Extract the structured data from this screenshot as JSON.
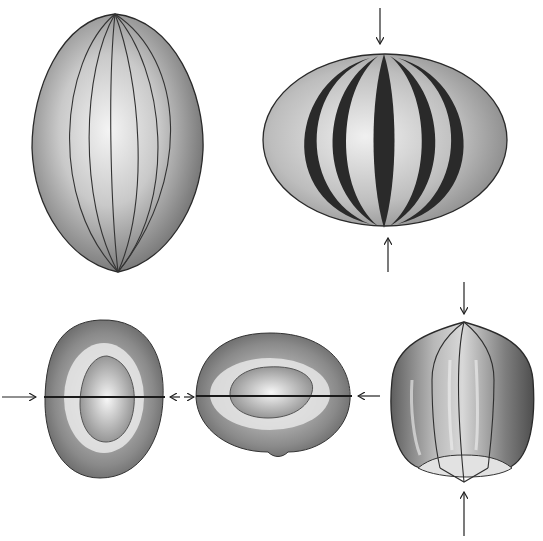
{
  "diagram": {
    "background": "#ffffff",
    "ink": "#1a1a1a",
    "figures": [
      {
        "id": "prolate-ribbed-ellipsoid",
        "position": "top-left",
        "arrows": 0,
        "ribs": 8
      },
      {
        "id": "oblate-striped-ellipsoid",
        "position": "top-right",
        "arrows": 2,
        "arrow_axis": "vertical",
        "stripes": 7
      },
      {
        "id": "cross-section-vertical-oval",
        "position": "bottom-left",
        "arrows": 2,
        "arrow_axis": "horizontal"
      },
      {
        "id": "cross-section-horizontal-oval",
        "position": "bottom-center",
        "arrows": 2,
        "arrow_axis": "horizontal"
      },
      {
        "id": "compressed-ribbed-body",
        "position": "bottom-right",
        "arrows": 2,
        "arrow_axis": "vertical"
      }
    ]
  }
}
